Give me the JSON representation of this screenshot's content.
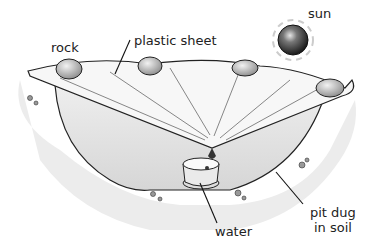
{
  "diagram": {
    "labels": {
      "sun": "sun",
      "rock": "rock",
      "plastic_sheet": "plastic sheet",
      "water": "water",
      "pit_line1": "pit dug",
      "pit_line2": "in soil"
    }
  }
}
